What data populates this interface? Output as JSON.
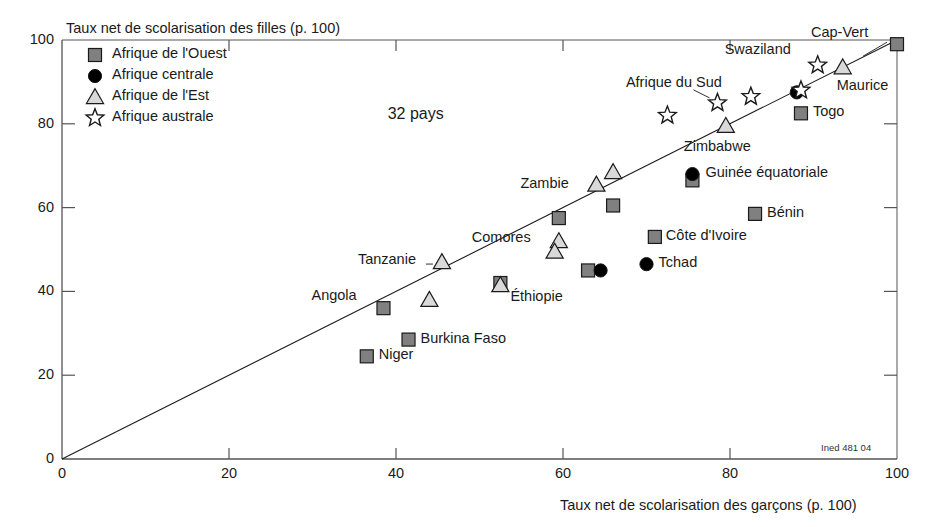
{
  "chart_data": {
    "type": "scatter",
    "title": "",
    "xlabel": "Taux net de scolarisation des garçons (p. 100)",
    "ylabel": "Taux net de scolarisation des filles (p. 100)",
    "xlim": [
      0,
      100
    ],
    "ylim": [
      0,
      100
    ],
    "xticks": [
      0,
      20,
      40,
      60,
      80,
      100
    ],
    "yticks": [
      0,
      20,
      40,
      60,
      80,
      100
    ],
    "grid": false,
    "annotation": "32 pays",
    "credit": "Ined 481 04",
    "reference_line": {
      "from": [
        0,
        0
      ],
      "to": [
        100,
        100
      ],
      "label": "diagonale y = x"
    },
    "legend": {
      "position": "top-left-inside",
      "entries": [
        {
          "marker": "square",
          "label": "Afrique de l'Ouest",
          "color": "#808080"
        },
        {
          "marker": "circle",
          "label": "Afrique centrale",
          "color": "#000000"
        },
        {
          "marker": "triangle",
          "label": "Afrique de l'Est",
          "color": "#d9d9d9"
        },
        {
          "marker": "star",
          "label": "Afrique australe",
          "color": "#ffffff"
        }
      ]
    },
    "series": [
      {
        "name": "Afrique de l'Ouest",
        "marker": "square",
        "points": [
          {
            "label": "Cap-Vert",
            "x": 100,
            "y": 99,
            "label_pos": "left"
          },
          {
            "label": "Togo",
            "x": 88.5,
            "y": 82.5,
            "label_pos": "right"
          },
          {
            "label": "Bénin",
            "x": 83,
            "y": 58.5,
            "label_pos": "right"
          },
          {
            "label": "Côte d'Ivoire",
            "x": 71,
            "y": 53,
            "label_pos": "right"
          },
          {
            "label": "",
            "x": 75.5,
            "y": 66.5,
            "label_pos": "none"
          },
          {
            "label": "",
            "x": 66,
            "y": 60.5,
            "label_pos": "none"
          },
          {
            "label": "",
            "x": 59.5,
            "y": 57.5,
            "label_pos": "none"
          },
          {
            "label": "",
            "x": 63,
            "y": 45,
            "label_pos": "none"
          },
          {
            "label": "",
            "x": 52.5,
            "y": 42,
            "label_pos": "none"
          },
          {
            "label": "Angola",
            "x": 38.5,
            "y": 36,
            "label_pos": "left"
          },
          {
            "label": "Burkina Faso",
            "x": 41.5,
            "y": 28.5,
            "label_pos": "right"
          },
          {
            "label": "Niger",
            "x": 36.5,
            "y": 24.5,
            "label_pos": "right"
          }
        ]
      },
      {
        "name": "Afrique centrale",
        "marker": "circle",
        "points": [
          {
            "label": "",
            "x": 88,
            "y": 87.5,
            "label_pos": "none"
          },
          {
            "label": "Guinée équatoriale",
            "x": 75.5,
            "y": 68,
            "label_pos": "right"
          },
          {
            "label": "Tchad",
            "x": 70,
            "y": 46.5,
            "label_pos": "right"
          },
          {
            "label": "",
            "x": 64.5,
            "y": 45,
            "label_pos": "none"
          }
        ]
      },
      {
        "name": "Afrique de l'Est",
        "marker": "triangle",
        "points": [
          {
            "label": "Maurice",
            "x": 93.5,
            "y": 93.5,
            "label_pos": "below"
          },
          {
            "label": "Zimbabwe",
            "x": 79.5,
            "y": 79.5,
            "label_pos": "below"
          },
          {
            "label": "",
            "x": 66,
            "y": 68.5,
            "label_pos": "none"
          },
          {
            "label": "Zambie",
            "x": 64,
            "y": 65.5,
            "label_pos": "left"
          },
          {
            "label": "Comores",
            "x": 59.5,
            "y": 52,
            "label_pos": "left"
          },
          {
            "label": "",
            "x": 59,
            "y": 49.5,
            "label_pos": "none"
          },
          {
            "label": "Éthiopie",
            "x": 52.5,
            "y": 41.5,
            "label_pos": "right"
          },
          {
            "label": "Tanzanie",
            "x": 45.5,
            "y": 47,
            "label_pos": "left"
          },
          {
            "label": "",
            "x": 44,
            "y": 38,
            "label_pos": "none"
          }
        ]
      },
      {
        "name": "Afrique australe",
        "marker": "star",
        "points": [
          {
            "label": "Swaziland",
            "x": 90.5,
            "y": 94,
            "label_pos": "left"
          },
          {
            "label": "",
            "x": 88.5,
            "y": 88,
            "label_pos": "none"
          },
          {
            "label": "Afrique du Sud",
            "x": 82.5,
            "y": 86.5,
            "label_pos": "left"
          },
          {
            "label": "",
            "x": 78.5,
            "y": 85,
            "label_pos": "none"
          },
          {
            "label": "",
            "x": 72.5,
            "y": 82,
            "label_pos": "none"
          }
        ]
      }
    ]
  },
  "axes": {
    "y_title": "Taux net de scolarisation des filles (p. 100)",
    "x_title": "Taux net de scolarisation des garçons (p. 100)",
    "x_tick_labels": [
      "0",
      "20",
      "40",
      "60",
      "80",
      "100"
    ],
    "y_tick_labels": [
      "0",
      "20",
      "40",
      "60",
      "80",
      "100"
    ]
  },
  "legend": {
    "items": [
      {
        "label": "Afrique de l'Ouest"
      },
      {
        "label": "Afrique centrale"
      },
      {
        "label": "Afrique de l'Est"
      },
      {
        "label": "Afrique australe"
      }
    ]
  },
  "annotations": {
    "country_count": "32 pays",
    "credit": "Ined 481 04"
  },
  "colors": {
    "square_fill": "#808080",
    "circle_fill": "#000000",
    "triangle_fill": "#d9d9d9",
    "star_fill": "#ffffff",
    "marker_stroke": "#1a1a1a",
    "axis": "#555555",
    "text": "#1a1a1a"
  }
}
